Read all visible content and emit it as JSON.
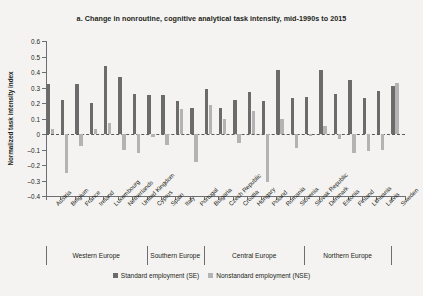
{
  "chart": {
    "title": "a. Change in nonroutine, cognitive analytical task intensity, mid-1990s to 2015",
    "ylabel": "Normalized task intensity index"
  },
  "legend": {
    "items": [
      {
        "label": "Standard employment (SE)",
        "color": "#6b6b6b",
        "key": "se"
      },
      {
        "label": "Nonstandard employment (NSE)",
        "color": "#b3b3b3",
        "key": "nse"
      }
    ]
  },
  "regions": [
    {
      "name": "Western Europe",
      "count": 7
    },
    {
      "name": "Southern Europe",
      "count": 4
    },
    {
      "name": "Central Europe",
      "count": 7
    },
    {
      "name": "Northern Europe",
      "count": 6
    }
  ],
  "chart_data": {
    "type": "bar",
    "title": "a. Change in nonroutine, cognitive analytical task intensity, mid-1990s to 2015",
    "xlabel": "",
    "ylabel": "Normalized task intensity index",
    "ylim": [
      -0.4,
      0.6
    ],
    "yticks": [
      0.6,
      0.5,
      0.4,
      0.3,
      0.2,
      0.1,
      0,
      -0.1,
      -0.2,
      -0.3,
      -0.4
    ],
    "ytick_labels": [
      "0.6",
      "0.5",
      "0.4",
      "0.3",
      "0.2",
      "0.1",
      "0",
      "–0.1",
      "–0.2",
      "–0.3",
      "–0.4"
    ],
    "grid": false,
    "legend_position": "bottom",
    "categories": [
      "Austria",
      "Belgium",
      "France",
      "Ireland",
      "Luxembourg",
      "Netherlands",
      "United Kingdom",
      "Cyprus",
      "Spain",
      "Italy",
      "Portugal",
      "Bulgaria",
      "Czech Republic",
      "Croatia",
      "Hungary",
      "Poland",
      "Romania",
      "Slovenia",
      "Slovak Republic",
      "Denmark",
      "Estonia",
      "Finland",
      "Lithuania",
      "Latvia",
      "Sweden"
    ],
    "series": [
      {
        "name": "Standard employment (SE)",
        "color": "#6b6b6b",
        "values": [
          0.32,
          0.22,
          0.32,
          0.2,
          0.44,
          0.37,
          0.26,
          0.25,
          0.25,
          0.21,
          0.17,
          0.29,
          0.17,
          0.22,
          0.27,
          0.21,
          0.41,
          0.23,
          0.24,
          0.41,
          0.26,
          0.35,
          0.23,
          0.28,
          0.31
        ]
      },
      {
        "name": "Nonstandard employment (NSE)",
        "color": "#b3b3b3",
        "values": [
          0.03,
          -0.25,
          -0.08,
          0.03,
          0.07,
          -0.1,
          -0.12,
          -0.02,
          -0.07,
          0.16,
          -0.18,
          0.19,
          0.1,
          -0.06,
          0.15,
          -0.31,
          0.1,
          -0.09,
          -0.01,
          0.05,
          -0.03,
          -0.12,
          -0.11,
          -0.1,
          0.33
        ]
      }
    ]
  }
}
